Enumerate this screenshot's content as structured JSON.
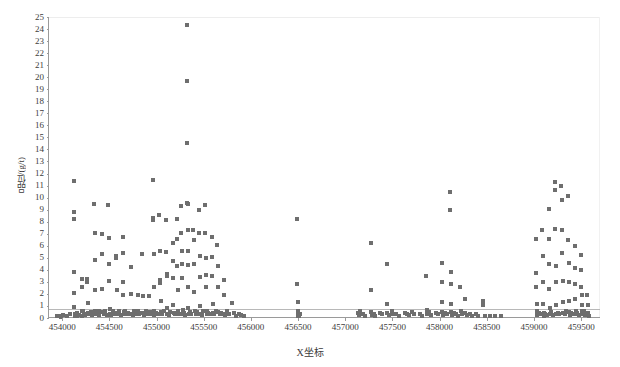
{
  "chart_data": {
    "type": "scatter",
    "title": "",
    "xlabel": "X坐标",
    "ylabel": "品位/(g/t)",
    "xlim": [
      453850,
      459700
    ],
    "ylim": [
      0,
      25
    ],
    "grid": true,
    "gridline_values": [
      0.75
    ],
    "legend": null,
    "xticks": [
      454000,
      454500,
      455000,
      455500,
      456000,
      456500,
      457000,
      457500,
      458000,
      458500,
      459000,
      459500
    ],
    "yticks": [
      0,
      1,
      2,
      3,
      4,
      5,
      6,
      7,
      8,
      9,
      10,
      11,
      12,
      13,
      14,
      15,
      16,
      17,
      18,
      19,
      20,
      21,
      22,
      23,
      24,
      25
    ],
    "marker": "square",
    "marker_color": "#6e6e6e",
    "marker_size_px": 4,
    "points": [
      [
        453930,
        0.15
      ],
      [
        453955,
        0.2
      ],
      [
        453975,
        0.1
      ],
      [
        453995,
        0.25
      ],
      [
        454040,
        0.2
      ],
      [
        454075,
        0.3
      ],
      [
        454110,
        11.4
      ],
      [
        454112,
        8.8
      ],
      [
        454114,
        8.2
      ],
      [
        454116,
        3.85
      ],
      [
        454118,
        2.05
      ],
      [
        454120,
        0.95
      ],
      [
        454122,
        0.35
      ],
      [
        454124,
        0.15
      ],
      [
        454145,
        0.2
      ],
      [
        454150,
        0.45
      ],
      [
        454170,
        0.25
      ],
      [
        454195,
        3.2
      ],
      [
        454198,
        2.6
      ],
      [
        454200,
        0.55
      ],
      [
        454205,
        0.2
      ],
      [
        454215,
        0.6
      ],
      [
        454225,
        0.35
      ],
      [
        454235,
        0.25
      ],
      [
        454255,
        3.25
      ],
      [
        454258,
        2.95
      ],
      [
        454260,
        1.25
      ],
      [
        454262,
        0.4
      ],
      [
        454275,
        0.3
      ],
      [
        454290,
        0.5
      ],
      [
        454305,
        0.25
      ],
      [
        454330,
        9.5
      ],
      [
        454333,
        7.05
      ],
      [
        454336,
        4.8
      ],
      [
        454339,
        2.35
      ],
      [
        454342,
        0.6
      ],
      [
        454345,
        0.3
      ],
      [
        454360,
        0.45
      ],
      [
        454375,
        0.25
      ],
      [
        454385,
        0.55
      ],
      [
        454410,
        6.95
      ],
      [
        454413,
        5.3
      ],
      [
        454416,
        2.45
      ],
      [
        454419,
        0.5
      ],
      [
        454430,
        0.3
      ],
      [
        454445,
        0.6
      ],
      [
        454460,
        0.25
      ],
      [
        454480,
        9.35
      ],
      [
        454483,
        6.65
      ],
      [
        454486,
        4.5
      ],
      [
        454489,
        3.1
      ],
      [
        454492,
        0.75
      ],
      [
        454495,
        0.3
      ],
      [
        454510,
        0.25
      ],
      [
        454525,
        0.55
      ],
      [
        454540,
        0.3
      ],
      [
        454560,
        5.15
      ],
      [
        454563,
        4.95
      ],
      [
        454566,
        2.3
      ],
      [
        454569,
        0.45
      ],
      [
        454580,
        0.35
      ],
      [
        454595,
        0.6
      ],
      [
        454610,
        0.25
      ],
      [
        454630,
        6.7
      ],
      [
        454633,
        5.4
      ],
      [
        454636,
        3.0
      ],
      [
        454639,
        1.95
      ],
      [
        454642,
        0.5
      ],
      [
        454645,
        0.3
      ],
      [
        454660,
        0.55
      ],
      [
        454675,
        0.3
      ],
      [
        454690,
        0.45
      ],
      [
        454715,
        4.25
      ],
      [
        454718,
        2.0
      ],
      [
        454721,
        0.35
      ],
      [
        454735,
        0.25
      ],
      [
        454750,
        0.6
      ],
      [
        454765,
        0.3
      ],
      [
        454790,
        1.9
      ],
      [
        454793,
        0.55
      ],
      [
        454805,
        0.3
      ],
      [
        454820,
        0.45
      ],
      [
        454840,
        5.3
      ],
      [
        454843,
        1.85
      ],
      [
        454846,
        0.4
      ],
      [
        454860,
        0.25
      ],
      [
        454875,
        0.55
      ],
      [
        454890,
        0.3
      ],
      [
        454915,
        1.85
      ],
      [
        454918,
        0.5
      ],
      [
        454930,
        0.3
      ],
      [
        454950,
        11.5
      ],
      [
        454953,
        8.3
      ],
      [
        454956,
        8.15
      ],
      [
        454959,
        5.3
      ],
      [
        454962,
        2.55
      ],
      [
        454965,
        0.6
      ],
      [
        454968,
        0.25
      ],
      [
        454985,
        0.45
      ],
      [
        455000,
        0.3
      ],
      [
        455020,
        8.55
      ],
      [
        455023,
        5.6
      ],
      [
        455026,
        3.15
      ],
      [
        455029,
        2.9
      ],
      [
        455032,
        1.45
      ],
      [
        455035,
        0.5
      ],
      [
        455050,
        0.3
      ],
      [
        455065,
        0.55
      ],
      [
        455090,
        8.1
      ],
      [
        455093,
        5.5
      ],
      [
        455096,
        3.65
      ],
      [
        455099,
        3.45
      ],
      [
        455102,
        0.85
      ],
      [
        455105,
        0.35
      ],
      [
        455120,
        0.25
      ],
      [
        455135,
        0.5
      ],
      [
        455160,
        6.25
      ],
      [
        455163,
        4.7
      ],
      [
        455166,
        3.35
      ],
      [
        455169,
        1.05
      ],
      [
        455172,
        0.4
      ],
      [
        455185,
        0.3
      ],
      [
        455205,
        8.2
      ],
      [
        455208,
        6.6
      ],
      [
        455211,
        4.3
      ],
      [
        455214,
        2.35
      ],
      [
        455217,
        0.6
      ],
      [
        455230,
        0.3
      ],
      [
        455250,
        9.3
      ],
      [
        455253,
        7.05
      ],
      [
        455256,
        5.55
      ],
      [
        455259,
        4.45
      ],
      [
        455262,
        3.3
      ],
      [
        455265,
        0.7
      ],
      [
        455268,
        0.3
      ],
      [
        455285,
        0.45
      ],
      [
        455295,
        0.25
      ],
      [
        455310,
        24.3
      ],
      [
        455312,
        19.7
      ],
      [
        455314,
        14.5
      ],
      [
        455316,
        9.55
      ],
      [
        455318,
        9.5
      ],
      [
        455320,
        7.3
      ],
      [
        455322,
        5.55
      ],
      [
        455324,
        4.4
      ],
      [
        455326,
        2.6
      ],
      [
        455328,
        0.8
      ],
      [
        455330,
        0.3
      ],
      [
        455345,
        0.5
      ],
      [
        455360,
        0.3
      ],
      [
        455380,
        7.35
      ],
      [
        455383,
        6.45
      ],
      [
        455386,
        4.5
      ],
      [
        455389,
        2.2
      ],
      [
        455392,
        0.55
      ],
      [
        455405,
        0.3
      ],
      [
        455420,
        0.5
      ],
      [
        455440,
        9.0
      ],
      [
        455443,
        7.1
      ],
      [
        455446,
        5.15
      ],
      [
        455449,
        3.4
      ],
      [
        455452,
        1.0
      ],
      [
        455455,
        0.35
      ],
      [
        455470,
        0.25
      ],
      [
        455485,
        0.55
      ],
      [
        455505,
        9.35
      ],
      [
        455508,
        7.1
      ],
      [
        455511,
        5.0
      ],
      [
        455514,
        3.6
      ],
      [
        455517,
        2.55
      ],
      [
        455520,
        0.6
      ],
      [
        455523,
        0.3
      ],
      [
        455540,
        0.45
      ],
      [
        455555,
        0.3
      ],
      [
        455575,
        6.75
      ],
      [
        455578,
        5.05
      ],
      [
        455581,
        3.5
      ],
      [
        455584,
        1.15
      ],
      [
        455587,
        0.4
      ],
      [
        455600,
        0.3
      ],
      [
        455615,
        0.55
      ],
      [
        455635,
        6.05
      ],
      [
        455638,
        4.3
      ],
      [
        455641,
        2.6
      ],
      [
        455644,
        0.5
      ],
      [
        455660,
        0.3
      ],
      [
        455675,
        0.45
      ],
      [
        455700,
        3.15
      ],
      [
        455703,
        1.9
      ],
      [
        455706,
        0.35
      ],
      [
        455720,
        0.25
      ],
      [
        455740,
        0.55
      ],
      [
        455760,
        0.3
      ],
      [
        455790,
        1.25
      ],
      [
        455810,
        0.4
      ],
      [
        455830,
        0.2
      ],
      [
        455860,
        0.3
      ],
      [
        455890,
        0.25
      ],
      [
        455920,
        0.2
      ],
      [
        456480,
        8.2
      ],
      [
        456483,
        2.8
      ],
      [
        456486,
        1.3
      ],
      [
        456488,
        0.6
      ],
      [
        456490,
        0.3
      ],
      [
        456492,
        0.15
      ],
      [
        456500,
        0.2
      ],
      [
        456505,
        0.35
      ],
      [
        457120,
        0.4
      ],
      [
        457135,
        0.25
      ],
      [
        457150,
        0.55
      ],
      [
        457180,
        0.3
      ],
      [
        457200,
        0.2
      ],
      [
        457260,
        6.25
      ],
      [
        457263,
        2.35
      ],
      [
        457266,
        0.5
      ],
      [
        457269,
        0.25
      ],
      [
        457290,
        0.35
      ],
      [
        457310,
        0.2
      ],
      [
        457360,
        0.45
      ],
      [
        457380,
        0.3
      ],
      [
        457430,
        4.45
      ],
      [
        457433,
        1.2
      ],
      [
        457436,
        0.4
      ],
      [
        457450,
        0.25
      ],
      [
        457480,
        0.55
      ],
      [
        457500,
        0.3
      ],
      [
        457530,
        0.35
      ],
      [
        457560,
        0.2
      ],
      [
        457620,
        0.45
      ],
      [
        457640,
        0.3
      ],
      [
        457660,
        0.25
      ],
      [
        457700,
        0.5
      ],
      [
        457720,
        0.3
      ],
      [
        457780,
        0.35
      ],
      [
        457800,
        0.2
      ],
      [
        457850,
        3.45
      ],
      [
        457853,
        0.65
      ],
      [
        457856,
        0.3
      ],
      [
        457880,
        0.5
      ],
      [
        457900,
        0.25
      ],
      [
        457950,
        0.4
      ],
      [
        457970,
        0.3
      ],
      [
        458010,
        4.55
      ],
      [
        458013,
        2.95
      ],
      [
        458016,
        1.35
      ],
      [
        458019,
        0.5
      ],
      [
        458022,
        0.25
      ],
      [
        458050,
        0.45
      ],
      [
        458070,
        0.3
      ],
      [
        458100,
        10.45
      ],
      [
        458103,
        9.0
      ],
      [
        458106,
        3.85
      ],
      [
        458109,
        2.8
      ],
      [
        458112,
        1.15
      ],
      [
        458115,
        0.5
      ],
      [
        458118,
        0.25
      ],
      [
        458140,
        0.4
      ],
      [
        458160,
        0.3
      ],
      [
        458180,
        0.2
      ],
      [
        458210,
        2.55
      ],
      [
        458213,
        0.55
      ],
      [
        458230,
        0.3
      ],
      [
        458260,
        1.6
      ],
      [
        458263,
        0.45
      ],
      [
        458280,
        0.25
      ],
      [
        458310,
        0.35
      ],
      [
        458330,
        0.2
      ],
      [
        458380,
        0.3
      ],
      [
        458400,
        0.15
      ],
      [
        458450,
        1.45
      ],
      [
        458453,
        1.05
      ],
      [
        458470,
        0.2
      ],
      [
        458520,
        0.15
      ],
      [
        458580,
        0.2
      ],
      [
        458640,
        0.15
      ],
      [
        459010,
        6.6
      ],
      [
        459013,
        3.7
      ],
      [
        459016,
        2.55
      ],
      [
        459019,
        1.15
      ],
      [
        459022,
        0.55
      ],
      [
        459025,
        0.25
      ],
      [
        459045,
        0.4
      ],
      [
        459060,
        0.3
      ],
      [
        459080,
        7.3
      ],
      [
        459083,
        5.15
      ],
      [
        459086,
        2.95
      ],
      [
        459089,
        1.15
      ],
      [
        459092,
        0.45
      ],
      [
        459095,
        0.2
      ],
      [
        459110,
        0.35
      ],
      [
        459125,
        0.25
      ],
      [
        459145,
        9.05
      ],
      [
        459148,
        6.55
      ],
      [
        459151,
        4.45
      ],
      [
        459154,
        2.45
      ],
      [
        459157,
        0.8
      ],
      [
        459160,
        0.3
      ],
      [
        459175,
        0.5
      ],
      [
        459190,
        0.25
      ],
      [
        459210,
        11.3
      ],
      [
        459213,
        10.6
      ],
      [
        459216,
        7.4
      ],
      [
        459219,
        4.3
      ],
      [
        459222,
        2.95
      ],
      [
        459225,
        1.1
      ],
      [
        459228,
        0.35
      ],
      [
        459245,
        0.45
      ],
      [
        459260,
        0.3
      ],
      [
        459280,
        11.0
      ],
      [
        459283,
        9.8
      ],
      [
        459286,
        7.35
      ],
      [
        459289,
        5.4
      ],
      [
        459292,
        3.05
      ],
      [
        459295,
        1.35
      ],
      [
        459298,
        0.45
      ],
      [
        459315,
        0.3
      ],
      [
        459330,
        0.55
      ],
      [
        459350,
        10.1
      ],
      [
        459353,
        6.5
      ],
      [
        459356,
        4.55
      ],
      [
        459359,
        2.95
      ],
      [
        459362,
        1.45
      ],
      [
        459365,
        0.5
      ],
      [
        459368,
        0.25
      ],
      [
        459385,
        0.4
      ],
      [
        459400,
        0.3
      ],
      [
        459420,
        6.0
      ],
      [
        459423,
        4.15
      ],
      [
        459426,
        2.85
      ],
      [
        459429,
        1.55
      ],
      [
        459432,
        0.6
      ],
      [
        459435,
        0.3
      ],
      [
        459450,
        0.45
      ],
      [
        459465,
        0.25
      ],
      [
        459485,
        5.2
      ],
      [
        459488,
        3.95
      ],
      [
        459491,
        2.6
      ],
      [
        459494,
        1.9
      ],
      [
        459497,
        1.05
      ],
      [
        459500,
        0.55
      ],
      [
        459503,
        0.3
      ],
      [
        459515,
        0.6
      ],
      [
        459525,
        0.4
      ],
      [
        459535,
        0.25
      ],
      [
        459545,
        0.3
      ],
      [
        459555,
        1.95
      ],
      [
        459558,
        1.05
      ],
      [
        459561,
        0.45
      ],
      [
        459570,
        0.2
      ]
    ]
  },
  "axes": {
    "y_title": "品位/(g/t)",
    "x_title": "X坐标",
    "x_tick_labels": [
      "454000",
      "454500",
      "455000",
      "455500",
      "456000",
      "456500",
      "457000",
      "457500",
      "458000",
      "458500",
      "459000",
      "459500"
    ],
    "y_tick_labels": [
      "25",
      "24",
      "23",
      "22",
      "21",
      "20",
      "19",
      "18",
      "17",
      "16",
      "15",
      "14",
      "13",
      "12",
      "11",
      "10",
      "9",
      "8",
      "7",
      "6",
      "5",
      "4",
      "3",
      "2",
      "1",
      "0"
    ]
  },
  "colors": {
    "marker": "#6e6e6e",
    "axis": "#9a9a9a",
    "gridline": "#b8b8b8",
    "text": "#3c3c3c",
    "background": "#ffffff"
  }
}
